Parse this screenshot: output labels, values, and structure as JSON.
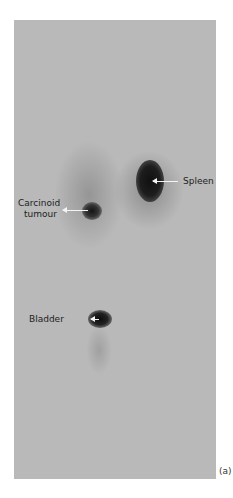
{
  "figure": {
    "panel_label": "(a)",
    "background_color": "#b9b9b9",
    "annotations": [
      {
        "label": "Spleen"
      },
      {
        "label_line1": "Carcinoid",
        "label_line2": "tumour"
      },
      {
        "label": "Bladder"
      }
    ]
  }
}
